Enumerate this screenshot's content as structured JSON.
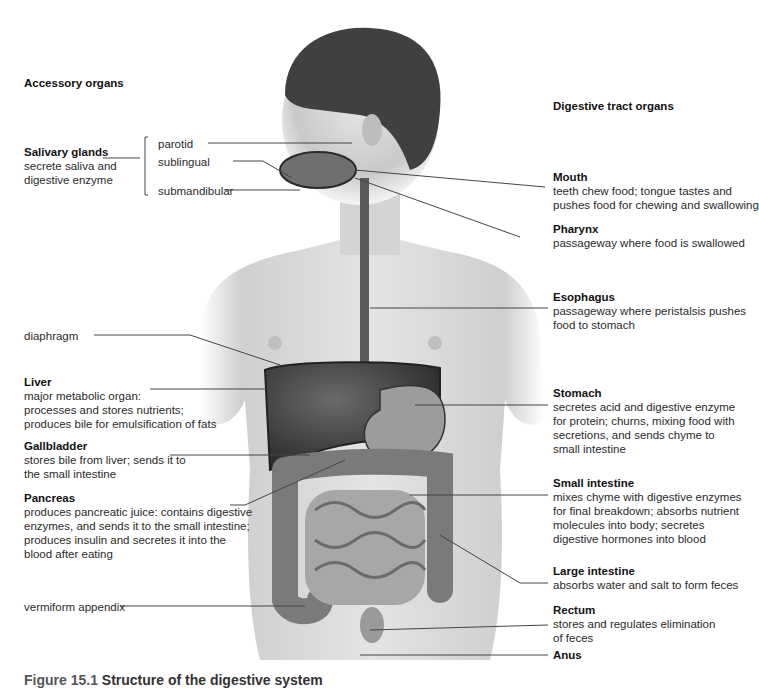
{
  "headings": {
    "accessory": "Accessory organs",
    "tract": "Digestive tract organs"
  },
  "left": {
    "salivary": {
      "title": "Salivary glands",
      "desc": [
        "secrete saliva and",
        "digestive enzyme"
      ]
    },
    "glands": [
      "parotid",
      "sublingual",
      "submandibular"
    ],
    "diaphragm": "diaphragm",
    "liver": {
      "title": "Liver",
      "desc": [
        "major metabolic organ:",
        "processes and stores nutrients;",
        "produces bile for emulsification of fats"
      ]
    },
    "gallbladder": {
      "title": "Gallbladder",
      "desc": [
        "stores bile from liver; sends it to",
        "the small intestine"
      ]
    },
    "pancreas": {
      "title": "Pancreas",
      "desc": [
        "produces pancreatic juice: contains digestive",
        "enzymes, and sends it to the small intestine;",
        "produces insulin and secretes it into the",
        "blood after eating"
      ]
    },
    "appendix": "vermiform appendix"
  },
  "right": {
    "mouth": {
      "title": "Mouth",
      "desc": [
        "teeth chew food; tongue tastes and",
        "pushes food for chewing and swallowing"
      ]
    },
    "pharynx": {
      "title": "Pharynx",
      "desc": [
        "passageway where food is swallowed"
      ]
    },
    "esophagus": {
      "title": "Esophagus",
      "desc": [
        "passageway where peristalsis pushes",
        "food to stomach"
      ]
    },
    "stomach": {
      "title": "Stomach",
      "desc": [
        "secretes acid and digestive enzyme",
        "for protein; churns, mixing food with",
        "secretions, and sends chyme to",
        "small intestine"
      ]
    },
    "small_intestine": {
      "title": "Small intestine",
      "desc": [
        "mixes chyme with digestive enzymes",
        "for final breakdown; absorbs nutrient",
        "molecules into body; secretes",
        "digestive hormones into blood"
      ]
    },
    "large_intestine": {
      "title": "Large intestine",
      "desc": [
        "absorbs water and salt to form feces"
      ]
    },
    "rectum": {
      "title": "Rectum",
      "desc": [
        "stores and regulates elimination",
        "of feces"
      ]
    },
    "anus": {
      "title": "Anus"
    }
  },
  "caption": {
    "number": "Figure 15.1",
    "text": "Structure of the digestive system"
  },
  "colors": {
    "skin": "#d9d9d9",
    "hair": "#3a3a3a",
    "liver": "#3c3c3c",
    "organ": "#8a8a8a",
    "line": "#444444"
  }
}
